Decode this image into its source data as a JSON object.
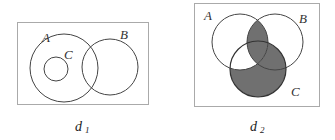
{
  "diagrams": [
    {
      "caption": "d",
      "caption_sub": "1",
      "labels": {
        "A": "A",
        "B": "B",
        "C": "C"
      },
      "description": "C subset of A; A and B overlap"
    },
    {
      "caption": "d",
      "caption_sub": "2",
      "labels": {
        "A": "A",
        "B": "B",
        "C": "C"
      },
      "description": "Three overlapping sets; shaded region is (A∩B) ∪ (C \\ (A\\B))",
      "shade_color": "#707070"
    }
  ],
  "colors": {
    "stroke": "#444444",
    "frame": "#999999",
    "shade": "#707070"
  }
}
